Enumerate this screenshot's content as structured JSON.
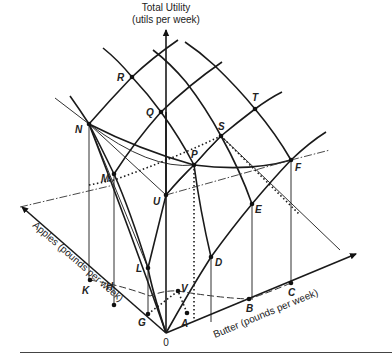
{
  "figure": {
    "vertical_axis_title_line1": "Total Utility",
    "vertical_axis_title_line2": "(utils per week)",
    "apples_axis_label": "Apples (pounds per week)",
    "butter_axis_label": "Butter (pounds per week)",
    "origin_label": "0",
    "points": {
      "R": "R",
      "Q": "Q",
      "N": "N",
      "M": "M",
      "P": "P",
      "S": "S",
      "T": "T",
      "F": "F",
      "U": "U",
      "L": "L",
      "D": "D",
      "E": "E",
      "K": "K",
      "H": "H",
      "G": "G",
      "V": "V",
      "A": "A",
      "B": "B",
      "C": "C"
    }
  }
}
